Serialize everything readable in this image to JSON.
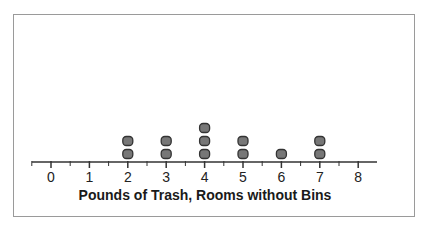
{
  "chart_data": {
    "type": "dot_plot",
    "title": "",
    "xlabel": "Pounds of Trash, Rooms without Bins",
    "ylabel": "",
    "categories": [
      0,
      1,
      2,
      3,
      4,
      5,
      6,
      7,
      8
    ],
    "values": [
      0,
      0,
      2,
      2,
      3,
      2,
      1,
      2,
      0
    ],
    "raw_data": [
      2,
      2,
      3,
      3,
      4,
      4,
      4,
      5,
      5,
      6,
      7,
      7
    ],
    "xlim": [
      0,
      8
    ],
    "tick_labels": [
      "0",
      "1",
      "2",
      "3",
      "4",
      "5",
      "6",
      "7",
      "8"
    ],
    "minor_ticks": "half-unit",
    "grid": false,
    "legend": null,
    "marker": "rounded-square dot",
    "marker_fill": "#777777",
    "marker_stroke": "#333333"
  }
}
